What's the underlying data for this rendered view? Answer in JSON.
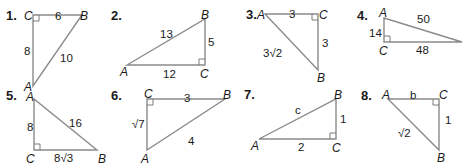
{
  "colors": {
    "stroke": "#8a8a8a",
    "text": "#1a1a1a",
    "background": "#ffffff"
  },
  "problems": [
    {
      "number": "1.",
      "vertices": {
        "A": "A",
        "B": "B",
        "C": "C"
      },
      "right_angle_at": "C",
      "sides": {
        "CB": "6",
        "CA": "8",
        "AB": "10"
      }
    },
    {
      "number": "2.",
      "vertices": {
        "A": "A",
        "B": "B",
        "C": "C"
      },
      "right_angle_at": "C",
      "sides": {
        "AB": "13",
        "BC": "5",
        "AC": "12"
      }
    },
    {
      "number": "3.",
      "vertices": {
        "A": "A",
        "B": "B",
        "C": "C"
      },
      "right_angle_at": "C",
      "sides": {
        "AC": "3",
        "CB": "3",
        "AB": "3√2"
      }
    },
    {
      "number": "4.",
      "vertices": {
        "A": "A",
        "B": "B",
        "C": "C"
      },
      "right_angle_at": "C",
      "sides": {
        "AB": "50",
        "AC": "14",
        "CB": "48"
      }
    },
    {
      "number": "5.",
      "vertices": {
        "A": "A",
        "B": "B",
        "C": "C"
      },
      "right_angle_at": "C",
      "sides": {
        "AC": "8",
        "AB": "16",
        "CB": "8√3"
      }
    },
    {
      "number": "6.",
      "vertices": {
        "A": "A",
        "B": "B",
        "C": "C"
      },
      "right_angle_at": "C",
      "sides": {
        "CB": "3",
        "CA": "√7",
        "AB": "4"
      }
    },
    {
      "number": "7.",
      "vertices": {
        "A": "A",
        "B": "B",
        "C": "C"
      },
      "right_angle_at": "C",
      "sides": {
        "AB": "c",
        "BC": "1",
        "AC": "2"
      }
    },
    {
      "number": "8.",
      "vertices": {
        "A": "A",
        "B": "B",
        "C": "C"
      },
      "right_angle_at": "C",
      "sides": {
        "AC": "b",
        "CB": "1",
        "AB": "√2"
      }
    }
  ]
}
